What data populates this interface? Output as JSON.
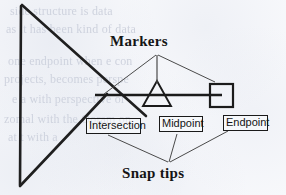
{
  "figure": {
    "kind": "line-diagram",
    "background_color": "#f7f8fb",
    "ink_color": "#1a1a1a",
    "headings": {
      "top": "Markers",
      "bottom": "Snap tips"
    },
    "callouts": [
      {
        "id": "intersection",
        "label": "Intersection"
      },
      {
        "id": "midpoint",
        "label": "Midpoint"
      },
      {
        "id": "endpoint",
        "label": "Endpoint"
      }
    ],
    "glyphs": [
      {
        "id": "intersection-cross",
        "shape": "x-crossing"
      },
      {
        "id": "midpoint-triangle",
        "shape": "triangle"
      },
      {
        "id": "endpoint-square",
        "shape": "square"
      }
    ],
    "ghost_text": [
      "side structure is data",
      "as it has been kind of data",
      "one endpoint when e con",
      "projects, becomes perspe",
      "e a with perspective or",
      "zomal with the Ooram on",
      "at t with a"
    ]
  }
}
